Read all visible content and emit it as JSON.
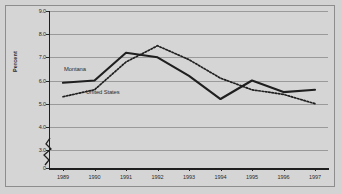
{
  "figure": {
    "background_color": "#d3d3d3",
    "border_color": "#8d8d8d",
    "plot_background_color": "#d5d5d5",
    "gridline_color": "#9a9a9a",
    "axis_color": "#1f1f1f",
    "series_color": "#1f1f1f"
  },
  "chart_data": {
    "type": "line",
    "title": "",
    "xlabel": "",
    "ylabel": "Percent",
    "x": [
      "1989",
      "1990",
      "1991",
      "1992",
      "1993",
      "1994",
      "1995",
      "1996",
      "1997"
    ],
    "categories": [
      "1989",
      "1990",
      "1991",
      "1992",
      "1993",
      "1994",
      "1995",
      "1996",
      "1997"
    ],
    "series": [
      {
        "name": "Montana",
        "style": "solid",
        "values": [
          5.9,
          6.0,
          7.2,
          7.0,
          6.2,
          5.2,
          6.0,
          5.5,
          5.6
        ]
      },
      {
        "name": "United States",
        "style": "dotted",
        "values": [
          5.3,
          5.6,
          6.8,
          7.5,
          6.9,
          6.1,
          5.6,
          5.4,
          5.0
        ]
      }
    ],
    "ylim": [
      3.0,
      9.0
    ],
    "y_axis_has_break": true,
    "y_tick_labels": [
      "9.0",
      "8.0",
      "7.0",
      "6.0",
      "5.0",
      "4.0",
      "3.0",
      "0"
    ],
    "y_tick_values": [
      9.0,
      8.0,
      7.0,
      6.0,
      5.0,
      4.0,
      3.0,
      0
    ],
    "grid": true,
    "grid_axis": "y",
    "legend": "inline-labels",
    "legend_position": "inside-plot-left"
  },
  "annotations": {
    "montana_label": "Montana",
    "united_states_label": "United States"
  }
}
